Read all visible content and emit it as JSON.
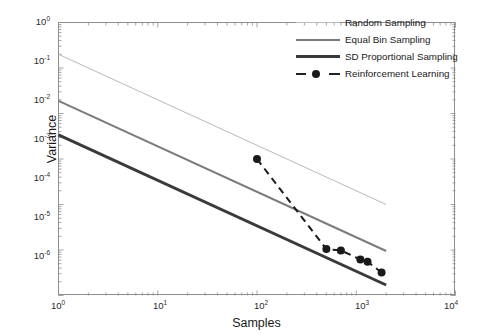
{
  "chart_data": {
    "type": "line",
    "title": "",
    "xlabel": "Samples",
    "ylabel": "Variance",
    "xscale": "log",
    "yscale": "log",
    "xlim": [
      1,
      10000
    ],
    "ylim": [
      1e-06,
      1
    ],
    "grid": false,
    "legend_position": "top-right",
    "x_tick_labels": [
      "10",
      "10",
      "10",
      "10",
      "10"
    ],
    "x_tick_exponents": [
      "0",
      "1",
      "2",
      "3",
      "4"
    ],
    "x_tick_values": [
      1,
      10,
      100,
      1000,
      10000
    ],
    "y_tick_labels": [
      "10",
      "10",
      "10",
      "10",
      "10",
      "10",
      "10"
    ],
    "y_tick_exponents": [
      "0",
      "-1",
      "-2",
      "-3",
      "-4",
      "-5",
      "-6"
    ],
    "y_tick_values": [
      1,
      0.1,
      0.01,
      0.001,
      0.0001,
      1e-05,
      1e-06
    ],
    "series": [
      {
        "name": "Random Sampling",
        "style": "solid-thin",
        "color": "#b9b9b9",
        "linewidth": 1,
        "marker": "none",
        "x": [
          1,
          2000
        ],
        "y": [
          0.2,
          0.0001
        ]
      },
      {
        "name": "Equal Bin Sampling",
        "style": "solid-medium",
        "color": "#7b7b7b",
        "linewidth": 2,
        "marker": "none",
        "x": [
          1,
          2000
        ],
        "y": [
          0.019,
          9.5e-06
        ]
      },
      {
        "name": "SD Proportional Sampling",
        "style": "solid-thick",
        "color": "#3a3a3a",
        "linewidth": 3,
        "marker": "none",
        "x": [
          1,
          2000
        ],
        "y": [
          0.0034,
          1.7e-06
        ]
      },
      {
        "name": "Reinforcement Learning",
        "style": "dashed",
        "color": "#1a1a1a",
        "linewidth": 2,
        "marker": "circle",
        "x": [
          100,
          500,
          700,
          1100,
          1300,
          1800
        ],
        "y": [
          0.001,
          1.05e-05,
          9.8e-06,
          6.2e-06,
          5.5e-06,
          3.2e-06
        ]
      }
    ]
  },
  "legend": {
    "items": [
      {
        "label": "Random Sampling"
      },
      {
        "label": "Equal Bin Sampling"
      },
      {
        "label": "SD Proportional Sampling"
      },
      {
        "label": "Reinforcement Learning"
      }
    ]
  }
}
